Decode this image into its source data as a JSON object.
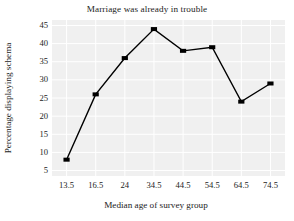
{
  "chart_data": {
    "type": "line",
    "title": "Marriage was already in trouble",
    "xlabel": "Median age of survey group",
    "ylabel": "Percentage displaying schema",
    "categories": [
      "13.5",
      "16.5",
      "24",
      "34.5",
      "44.5",
      "54.5",
      "64.5",
      "74.5"
    ],
    "x": [
      13.5,
      16.5,
      24,
      34.5,
      44.5,
      54.5,
      64.5,
      74.5
    ],
    "values": [
      8,
      26,
      36,
      44,
      38,
      39,
      24,
      29
    ],
    "yticks": [
      5,
      10,
      15,
      20,
      25,
      30,
      35,
      40,
      45
    ],
    "ylim": [
      3.5,
      46.5
    ],
    "xtick_labels": [
      "13.5",
      "16.5",
      "24",
      "34.5",
      "44.5",
      "54.5",
      "64.5",
      "74.5"
    ],
    "grid": true,
    "gridline_color": "#ffffff",
    "plot_background": "#f0f0f0",
    "line_color": "#000000",
    "marker": "square",
    "marker_color": "#000000",
    "legend": null,
    "series": [
      {
        "name": "Percentage displaying schema",
        "values": [
          8,
          26,
          36,
          44,
          38,
          39,
          24,
          29
        ]
      }
    ]
  }
}
